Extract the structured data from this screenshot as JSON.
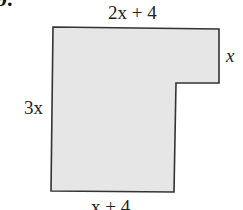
{
  "problem": {
    "number_label": "9."
  },
  "figure": {
    "type": "L-shaped polygon",
    "fill_color": "#e6e6e6",
    "stroke_color": "#333333",
    "labels": {
      "top": "2x + 4",
      "right": "x",
      "left": "3x",
      "bottom": "x + 4"
    }
  }
}
